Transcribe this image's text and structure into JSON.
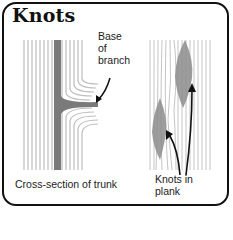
{
  "title": "Knots",
  "labels": {
    "base_of_branch": [
      "Base",
      "of",
      "branch"
    ],
    "cross_section": "Cross-section of trunk",
    "knots_in_plank": [
      "Knots in",
      "plank"
    ]
  },
  "colors": {
    "border": "#111111",
    "grain": "#b8b8b8",
    "pith": "#777777",
    "knot": "#8a8a8a"
  }
}
